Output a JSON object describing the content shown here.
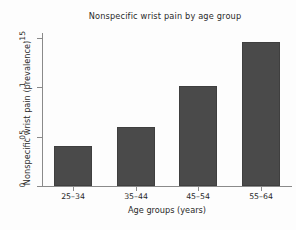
{
  "chart_data": {
    "type": "bar",
    "title": "Nonspecific wrist pain by age group",
    "xlabel": "Age groups (years)",
    "ylabel": "Nonspecific wrist pain (prevalence)",
    "categories": [
      "25–34",
      "35–44",
      "45–54",
      "55–64"
    ],
    "values": [
      0.041,
      0.06,
      0.101,
      0.146
    ],
    "ylim": [
      0,
      0.155
    ],
    "ytick_values": [
      0,
      0.05,
      0.1,
      0.15
    ],
    "ytick_labels": [
      "0",
      ".05",
      ".1",
      ".15"
    ],
    "grid": false,
    "legend": false,
    "bar_color": "#4a4a4a",
    "axis_color": "#8a8a8a",
    "background_color": "#fdfdfd"
  }
}
